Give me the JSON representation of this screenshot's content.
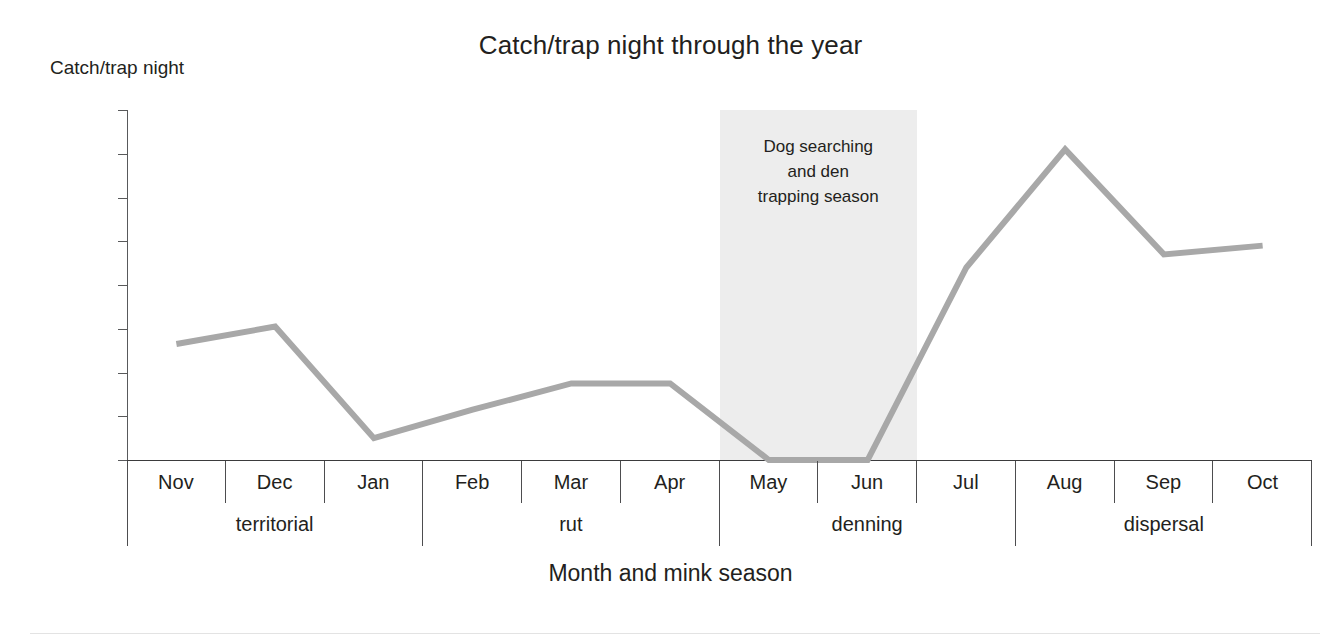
{
  "chart_data": {
    "type": "line",
    "title": "Catch/trap night through the year",
    "xlabel": "Month and mink season",
    "ylabel": "Catch/trap night",
    "categories": [
      "Nov",
      "Dec",
      "Jan",
      "Feb",
      "Mar",
      "Apr",
      "May",
      "Jun",
      "Jul",
      "Aug",
      "Sep",
      "Oct"
    ],
    "values": [
      0.0053,
      0.0061,
      0.001,
      0.0023,
      0.0035,
      0.0035,
      0.0,
      0.0,
      0.0088,
      0.0142,
      0.0094,
      0.0098
    ],
    "ytick_labels": [
      "0.013",
      "0.014",
      "0.012",
      "0.01",
      "0.008",
      "0.006",
      "0.004",
      "0.002",
      "0"
    ],
    "ytick_positions": [
      0.016,
      0.014,
      0.012,
      0.01,
      0.008,
      0.006,
      0.004,
      0.002,
      0
    ],
    "ylim": [
      0,
      0.016
    ],
    "grid": false,
    "legend": "none",
    "line_color": "#a8a8a8",
    "line_width": 6,
    "groups": [
      {
        "label": "territorial",
        "months": [
          "Nov",
          "Dec",
          "Jan"
        ]
      },
      {
        "label": "rut",
        "months": [
          "Feb",
          "Mar",
          "Apr"
        ]
      },
      {
        "label": "denning",
        "months": [
          "May",
          "Jun",
          "Jul"
        ]
      },
      {
        "label": "dispersal",
        "months": [
          "Aug",
          "Sep",
          "Oct"
        ]
      }
    ],
    "annotations": [
      {
        "text": "Dog searching and den trapping season",
        "lines": [
          "Dog searching",
          "and den",
          "trapping season"
        ],
        "span_start": "May",
        "span_end": "Jun",
        "band_color": "#ededed"
      }
    ]
  },
  "axis": {
    "y_caption": "Catch/trap night",
    "x_caption": "Month and mink season"
  }
}
